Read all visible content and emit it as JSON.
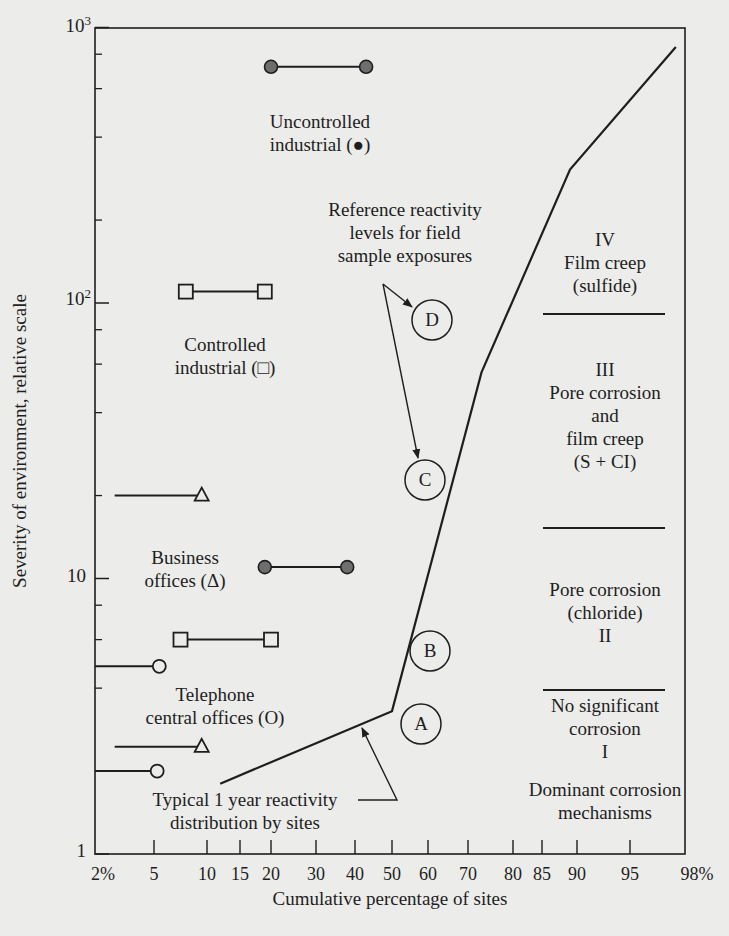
{
  "chart_data": {
    "type": "line",
    "title": "",
    "xlabel": "Cumulative percentage of sites",
    "ylabel": "Severity of environment, relative scale",
    "x_scale": "probability (normal cumulative)",
    "y_scale": "log",
    "ylim": [
      1,
      1000
    ],
    "xlim": [
      2,
      98
    ],
    "x_ticks": [
      "2%",
      "5",
      "10",
      "15",
      "20",
      "30",
      "40",
      "50",
      "60",
      "70",
      "80",
      "85",
      "90",
      "95",
      "98%"
    ],
    "y_ticks": [
      "1",
      "10",
      "10²",
      "10³"
    ],
    "grid": false,
    "series": [
      {
        "name": "Typical 1 year reactivity distribution by sites",
        "kind": "line",
        "points": [
          [
            12,
            1.8
          ],
          [
            50,
            3.3
          ],
          [
            73,
            56
          ],
          [
            89,
            305
          ],
          [
            97.5,
            850
          ]
        ]
      },
      {
        "name": "Uncontrolled industrial (filled circle)",
        "kind": "range",
        "marker": "filled-circle",
        "points": [
          [
            20,
            720
          ],
          [
            43,
            720
          ]
        ]
      },
      {
        "name": "Controlled industrial (square)",
        "kind": "range",
        "marker": "square",
        "points": [
          [
            8,
            110
          ],
          [
            19,
            110
          ]
        ]
      },
      {
        "name": "Business offices (triangle) upper",
        "kind": "range",
        "marker": "triangle",
        "points": [
          [
            3,
            20
          ],
          [
            9.5,
            20
          ]
        ]
      },
      {
        "name": "Uncontrolled industrial (filled circle) lower",
        "kind": "range",
        "marker": "filled-circle",
        "points": [
          [
            19,
            11
          ],
          [
            38,
            11
          ]
        ]
      },
      {
        "name": "Controlled industrial (square) lower",
        "kind": "range",
        "marker": "square",
        "points": [
          [
            7.5,
            6
          ],
          [
            20,
            6
          ]
        ]
      },
      {
        "name": "Telephone central offices (circle) upper",
        "kind": "range",
        "marker": "open-circle",
        "points": [
          [
            2,
            4.8
          ],
          [
            5.5,
            4.8
          ]
        ]
      },
      {
        "name": "Business offices (triangle) lower",
        "kind": "range",
        "marker": "triangle",
        "points": [
          [
            3,
            2.45
          ],
          [
            9.5,
            2.45
          ]
        ]
      },
      {
        "name": "Telephone central offices (circle) lower",
        "kind": "range",
        "marker": "open-circle",
        "points": [
          [
            2,
            2.0
          ],
          [
            5.3,
            2.0
          ]
        ]
      }
    ],
    "reference_levels": [
      {
        "label": "A",
        "x": 57,
        "y": 3.0
      },
      {
        "label": "B",
        "x": 59,
        "y": 5.5
      },
      {
        "label": "C",
        "x": 58,
        "y": 28
      },
      {
        "label": "D",
        "x": 60,
        "y": 90
      }
    ],
    "annotations": {
      "uncontrolled": [
        "Uncontrolled",
        "industrial (●)"
      ],
      "controlled": [
        "Controlled",
        "industrial (□)"
      ],
      "business": [
        "Business",
        "offices (Δ)"
      ],
      "telephone": [
        "Telephone",
        "central offices (O)"
      ],
      "typical": [
        "Typical 1 year reactivity",
        "distribution by sites"
      ],
      "reference": [
        "Reference reactivity",
        "levels for field",
        "sample exposures"
      ],
      "zone_iv": [
        "IV",
        "Film creep",
        "(sulfide)"
      ],
      "zone_iii": [
        "III",
        "Pore corrosion",
        "and",
        "film creep",
        "(S + CI)"
      ],
      "zone_ii": [
        "Pore corrosion",
        "(chloride)",
        "II"
      ],
      "zone_i": [
        "No significant",
        "corrosion",
        "I"
      ],
      "mechanisms": [
        "Dominant corrosion",
        "mechanisms"
      ]
    }
  },
  "colors": {
    "ink": "#1e1e1e",
    "marker_fill": "#6e6e6e",
    "background": "#ececea"
  }
}
